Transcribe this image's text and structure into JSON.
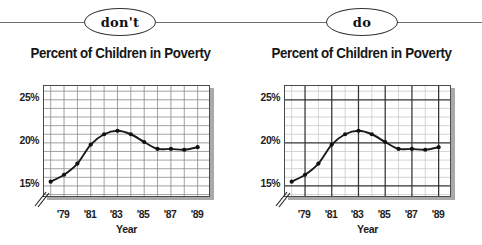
{
  "divider": {
    "label_dont": "don't",
    "label_do": "do"
  },
  "panels": [
    {
      "key": "dont",
      "badge": "don't",
      "title": "Percent of Children in Poverty",
      "grid_style": "uniform-dark-minor-grid",
      "emphasize_major_gridlines": false
    },
    {
      "key": "do",
      "badge": "do",
      "title": "Percent of Children in Poverty",
      "grid_style": "light-minor-grid-with-dark-major",
      "emphasize_major_gridlines": true
    }
  ],
  "colors": {
    "line": "#1a1a1a",
    "marker": "#111111",
    "minor_grid_dont": "#8d8d8d",
    "minor_grid_do": "#c9c9c9",
    "major_grid_do": "#333333",
    "plot_border": "#4a4a4a",
    "shadow": "#a9a9a9",
    "text": "#1d1d1d",
    "divider_line": "#6e6e6e",
    "background": "#ffffff"
  },
  "chart_data": [
    {
      "type": "line",
      "title": "Percent of Children in Poverty",
      "xlabel": "Year",
      "ylabel": "",
      "panel": "don't",
      "x": [
        1978,
        1979,
        1980,
        1981,
        1982,
        1983,
        1984,
        1985,
        1986,
        1987,
        1988,
        1989
      ],
      "values": [
        15.5,
        16.3,
        17.6,
        19.8,
        21.0,
        21.4,
        21.0,
        20.1,
        19.3,
        19.3,
        19.2,
        19.5
      ],
      "xtick_labels": [
        "'79",
        "'81",
        "'83",
        "'85",
        "'87",
        "'89"
      ],
      "xtick_values": [
        1979,
        1981,
        1983,
        1985,
        1987,
        1989
      ],
      "ytick_labels": [
        "15%",
        "20%",
        "25%"
      ],
      "ytick_values": [
        15,
        20,
        25
      ],
      "xlim": [
        1977.5,
        1990.0
      ],
      "ylim": [
        13.6,
        26.6
      ],
      "y_axis_break": true,
      "grid": true,
      "grid_emphasis": "none",
      "legend": "none",
      "markers": true
    },
    {
      "type": "line",
      "title": "Percent of Children in Poverty",
      "xlabel": "Year",
      "ylabel": "",
      "panel": "do",
      "x": [
        1978,
        1979,
        1980,
        1981,
        1982,
        1983,
        1984,
        1985,
        1986,
        1987,
        1988,
        1989
      ],
      "values": [
        15.5,
        16.3,
        17.6,
        19.8,
        21.0,
        21.4,
        21.0,
        20.1,
        19.3,
        19.3,
        19.2,
        19.5
      ],
      "xtick_labels": [
        "'79",
        "'81",
        "'83",
        "'85",
        "'87",
        "'89"
      ],
      "xtick_values": [
        1979,
        1981,
        1983,
        1985,
        1987,
        1989
      ],
      "ytick_labels": [
        "15%",
        "20%",
        "25%"
      ],
      "ytick_values": [
        15,
        20,
        25
      ],
      "xlim": [
        1977.5,
        1990.0
      ],
      "ylim": [
        13.6,
        26.6
      ],
      "y_axis_break": true,
      "grid": true,
      "grid_emphasis": "major-ticks-darkened",
      "legend": "none",
      "markers": true
    }
  ]
}
